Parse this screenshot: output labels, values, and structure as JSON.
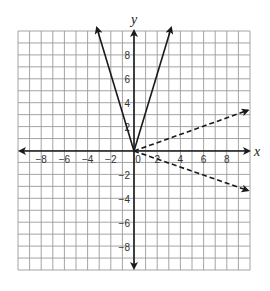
{
  "chart_data": {
    "type": "line",
    "title": "",
    "xlabel": "x",
    "ylabel": "y",
    "xlim": [
      -10,
      10
    ],
    "ylim": [
      -10,
      10
    ],
    "grid": true,
    "x_ticks": [
      -8,
      -6,
      -4,
      -2,
      0,
      2,
      4,
      6,
      8
    ],
    "y_ticks": [
      -8,
      -6,
      -4,
      -2,
      2,
      4,
      6,
      8
    ],
    "x_tick_labels": [
      "-8",
      "-6",
      "-4",
      "-2",
      "0",
      "2",
      "4",
      "6",
      "8"
    ],
    "y_tick_labels": [
      "8",
      "6",
      "4",
      "2",
      "-2",
      "-4",
      "-6",
      "-8"
    ],
    "series": [
      {
        "name": "y = 3x (x ≥ 0)",
        "style": "solid",
        "points": [
          [
            0,
            0
          ],
          [
            3.2,
            10.3
          ]
        ]
      },
      {
        "name": "y = -3x (x ≤ 0)",
        "style": "solid",
        "points": [
          [
            0,
            0
          ],
          [
            -3.2,
            10.3
          ]
        ]
      },
      {
        "name": "y = x/3 (x ≥ 0)",
        "style": "dashed",
        "points": [
          [
            0,
            0
          ],
          [
            9.8,
            3.4
          ]
        ]
      },
      {
        "name": "y = -x/3 (x ≥ 0)",
        "style": "dashed",
        "points": [
          [
            0,
            0
          ],
          [
            9.8,
            -3.3
          ]
        ]
      }
    ],
    "legend": null
  },
  "labels": {
    "x_axis": "x",
    "y_axis": "y"
  },
  "colors": {
    "grid": "#9a9a9a",
    "axis": "#1a1a1a",
    "line": "#1a1a1a"
  }
}
